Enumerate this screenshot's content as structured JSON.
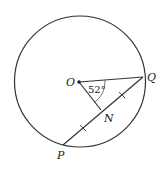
{
  "diagram": {
    "type": "circle-geometry",
    "circle": {
      "center_label": "O",
      "cx": 80,
      "cy": 81.5,
      "r": 65.5
    },
    "points": {
      "O": {
        "label": "O",
        "x": 79,
        "y": 82
      },
      "Q": {
        "label": "Q",
        "x": 143,
        "y": 77
      },
      "P": {
        "label": "P",
        "x": 63,
        "y": 145
      },
      "N": {
        "label": "N",
        "x": 101,
        "y": 110
      }
    },
    "angle": {
      "at": "O",
      "between": [
        "Q",
        "N"
      ],
      "label": "52°"
    },
    "segments": [
      "OQ",
      "ON",
      "PQ"
    ],
    "equal_marks": [
      "PN",
      "NQ"
    ],
    "colors": {
      "stroke": "#333333",
      "background": "#ffffff"
    }
  }
}
